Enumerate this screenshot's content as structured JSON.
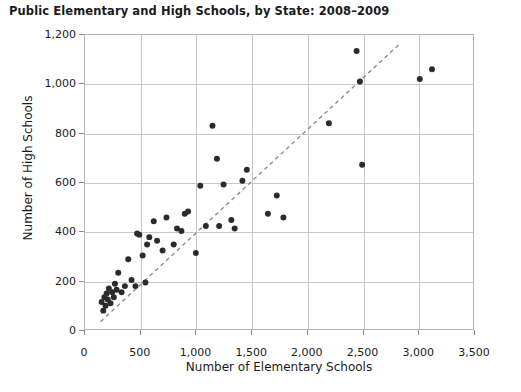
{
  "chart_data": {
    "type": "scatter",
    "title": "Public Elementary and High Schools, by State: 2008–2009",
    "xlabel": "Number of Elementary Schools",
    "ylabel": "Number of High Schools",
    "xlim": [
      0,
      3500
    ],
    "ylim": [
      0,
      1200
    ],
    "xticks": [
      0,
      500,
      1000,
      1500,
      2000,
      2500,
      3000,
      3500
    ],
    "yticks": [
      0,
      200,
      400,
      600,
      800,
      1000,
      1200
    ],
    "xtick_labels": [
      "0",
      "500",
      "1,000",
      "1,500",
      "2,000",
      "2,500",
      "3,000",
      "3,500"
    ],
    "ytick_labels": [
      "0",
      "200",
      "400",
      "600",
      "800",
      "1,000",
      "1,200"
    ],
    "grid": true,
    "legend": null,
    "marker_color": "#2b2b2b",
    "marker_size": 6,
    "grid_color": "#c8c8c8",
    "axis_color": "#b3b3b3",
    "trendline": {
      "style": "dashed",
      "color": "#8c8c8c",
      "x_start": 140,
      "y_start": 30,
      "x_end": 2830,
      "y_end": 1160
    },
    "points": [
      [
        150,
        110
      ],
      [
        165,
        75
      ],
      [
        175,
        130
      ],
      [
        185,
        95
      ],
      [
        195,
        145
      ],
      [
        205,
        120
      ],
      [
        215,
        165
      ],
      [
        230,
        105
      ],
      [
        245,
        150
      ],
      [
        260,
        130
      ],
      [
        270,
        185
      ],
      [
        285,
        160
      ],
      [
        300,
        230
      ],
      [
        330,
        150
      ],
      [
        360,
        175
      ],
      [
        390,
        285
      ],
      [
        420,
        200
      ],
      [
        455,
        175
      ],
      [
        470,
        390
      ],
      [
        490,
        385
      ],
      [
        520,
        300
      ],
      [
        545,
        190
      ],
      [
        560,
        345
      ],
      [
        580,
        375
      ],
      [
        620,
        440
      ],
      [
        650,
        360
      ],
      [
        700,
        320
      ],
      [
        735,
        455
      ],
      [
        800,
        345
      ],
      [
        830,
        410
      ],
      [
        870,
        400
      ],
      [
        900,
        470
      ],
      [
        930,
        480
      ],
      [
        1000,
        310
      ],
      [
        1040,
        585
      ],
      [
        1090,
        420
      ],
      [
        1150,
        830
      ],
      [
        1190,
        695
      ],
      [
        1210,
        420
      ],
      [
        1250,
        590
      ],
      [
        1320,
        445
      ],
      [
        1350,
        410
      ],
      [
        1420,
        605
      ],
      [
        1460,
        650
      ],
      [
        1650,
        470
      ],
      [
        1730,
        545
      ],
      [
        1790,
        455
      ],
      [
        2200,
        840
      ],
      [
        2450,
        1135
      ],
      [
        2480,
        1010
      ],
      [
        2500,
        670
      ],
      [
        3020,
        1020
      ],
      [
        3130,
        1060
      ]
    ]
  }
}
